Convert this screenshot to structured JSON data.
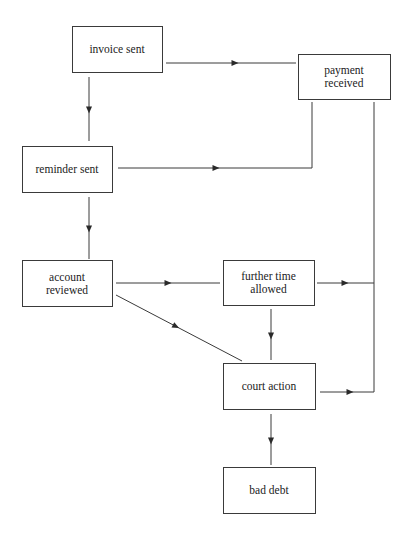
{
  "diagram": {
    "type": "flowchart",
    "colors": {
      "line": "#3a3a3a",
      "text": "#222222",
      "background": "#ffffff"
    },
    "nodes": [
      {
        "id": "invoice",
        "lines": [
          "invoice sent"
        ]
      },
      {
        "id": "payment",
        "lines": [
          "payment",
          "received"
        ]
      },
      {
        "id": "reminder",
        "lines": [
          "reminder sent"
        ]
      },
      {
        "id": "account",
        "lines": [
          "account",
          "reviewed"
        ]
      },
      {
        "id": "further",
        "lines": [
          "further time",
          "allowed"
        ]
      },
      {
        "id": "court",
        "lines": [
          "court action"
        ]
      },
      {
        "id": "baddebt",
        "lines": [
          "bad debt"
        ]
      }
    ],
    "edges": [
      {
        "from": "invoice",
        "to": "payment"
      },
      {
        "from": "invoice",
        "to": "reminder"
      },
      {
        "from": "reminder",
        "to": "payment"
      },
      {
        "from": "reminder",
        "to": "account"
      },
      {
        "from": "account",
        "to": "further"
      },
      {
        "from": "account",
        "to": "court"
      },
      {
        "from": "further",
        "to": "court"
      },
      {
        "from": "further",
        "to": "payment"
      },
      {
        "from": "court",
        "to": "payment"
      },
      {
        "from": "court",
        "to": "baddebt"
      }
    ]
  }
}
